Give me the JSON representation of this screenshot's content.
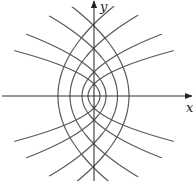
{
  "figure": {
    "width": 195,
    "height": 181,
    "origin_px": [
      94,
      96
    ],
    "clip_radius_px": 92,
    "colors": {
      "curve": "#5a5a5a",
      "axis": "#333333",
      "label": "#222222",
      "background": "#ffffff"
    },
    "axes": {
      "x_label": "x",
      "y_label": "y",
      "x_label_pos": [
        186,
        112
      ],
      "y_label_pos": [
        100,
        11
      ]
    },
    "families": [
      {
        "name": "left-opening parabolas",
        "equation": "y^2 = 4a(a - x)",
        "a_values": [
          6,
          12,
          23.5,
          35
        ]
      },
      {
        "name": "right-opening parabolas",
        "equation": "y^2 = 4a(x + a)",
        "a_values": [
          6,
          12,
          24,
          36
        ]
      }
    ]
  }
}
